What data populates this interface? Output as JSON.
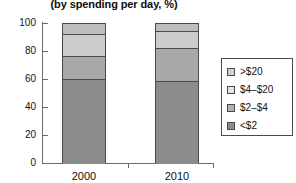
{
  "chart_data": {
    "type": "bar",
    "title": "(by spending per day, %)",
    "subtitle": "",
    "xlabel": "",
    "ylabel": "",
    "stacked": true,
    "grid": false,
    "legend_position": "right",
    "ylim": [
      0,
      100
    ],
    "yticks": [
      0,
      20,
      40,
      60,
      80,
      100
    ],
    "ytick_labels": [
      "0",
      "20",
      "40",
      "60",
      "80",
      "100"
    ],
    "categories": [
      "2000",
      "2010"
    ],
    "series": [
      {
        "name": "<$2",
        "color": "#8c8c8c",
        "values": [
          61,
          59
        ]
      },
      {
        "name": "$2-$4",
        "color": "#a8a8a8",
        "values": [
          16,
          24
        ]
      },
      {
        "name": "$4-$20",
        "color": "#cccccc",
        "values": [
          16,
          12
        ]
      },
      {
        "name": ">$20",
        "color": "#bdbdbd",
        "values": [
          7,
          5
        ]
      }
    ],
    "legend_entries": [
      {
        "label": ">$20",
        "color": "#cfcfcf"
      },
      {
        "label": "$4–$20",
        "color": "#e2e2e2"
      },
      {
        "label": "$2–$4",
        "color": "#b3b3b3"
      },
      {
        "label": "<$2",
        "color": "#8c8c8c"
      }
    ]
  },
  "axis": {
    "y_labels": [
      "100",
      "80",
      "60",
      "40",
      "20",
      "0"
    ],
    "x_labels": [
      "2000",
      "2010"
    ]
  },
  "colors": {
    "axis": "#6b6b6b",
    "outline": "#4a4a4a",
    "background": "#ffffff"
  }
}
